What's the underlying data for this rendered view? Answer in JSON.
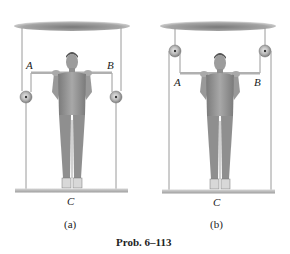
{
  "figure": {
    "panels": [
      {
        "id": "a",
        "caption": "(a)",
        "labels": {
          "left_bar_end": "A",
          "right_bar_end": "B",
          "platform": "C"
        },
        "pulley_position": "below-bar"
      },
      {
        "id": "b",
        "caption": "(b)",
        "labels": {
          "left_bar_end": "A",
          "right_bar_end": "B",
          "platform": "C"
        },
        "pulley_position": "above-bar"
      }
    ],
    "problem_label": "Prob. 6–113"
  },
  "colors": {
    "ceiling": "#8a8a8a",
    "rope": "#9a9a9a",
    "bar": "#b0b0b0",
    "platform": "#bdbdbd",
    "pulley": "#a0a0a0",
    "person": "#8c8c8c",
    "text": "#222222"
  }
}
